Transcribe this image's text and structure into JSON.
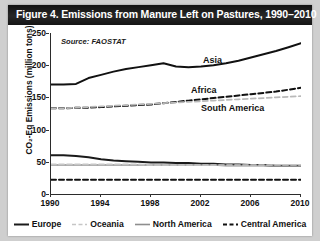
{
  "figure": {
    "title": "Figure 4. Emissions from Manure Left on Pastures, 1990–2010",
    "source_note": "Source: FAOSTAT"
  },
  "chart_data": {
    "type": "line",
    "title": "Figure 4. Emissions from Manure Left on Pastures, 1990–2010",
    "xlabel": "",
    "ylabel": "CO₂-Eq Emissions (million tons)",
    "xlim": [
      1990,
      2010
    ],
    "ylim": [
      0,
      250
    ],
    "yticks": [
      0,
      50,
      100,
      150,
      200,
      250
    ],
    "xticks": [
      1990,
      1994,
      1998,
      2002,
      2006,
      2010
    ],
    "grid": false,
    "legend_position": "bottom",
    "annotations": [
      "Source: FAOSTAT"
    ],
    "inline_labels": [
      "Asia",
      "Africa",
      "South America"
    ],
    "x": [
      1990,
      1991,
      1992,
      1993,
      1994,
      1995,
      1996,
      1997,
      1998,
      1999,
      2000,
      2001,
      2002,
      2003,
      2004,
      2005,
      2006,
      2007,
      2008,
      2009,
      2010
    ],
    "series": [
      {
        "name": "Asia",
        "style": "solid-black",
        "color": "#111111",
        "values": [
          170,
          170,
          171,
          180,
          185,
          190,
          194,
          197,
          200,
          203,
          198,
          197,
          198,
          200,
          203,
          207,
          212,
          217,
          222,
          228,
          234
        ]
      },
      {
        "name": "Africa",
        "style": "dashed-black",
        "color": "#111111",
        "values": [
          133,
          133,
          134,
          134,
          135,
          136,
          137,
          138,
          139,
          141,
          143,
          145,
          147,
          149,
          151,
          153,
          155,
          157,
          159,
          162,
          165
        ]
      },
      {
        "name": "South America",
        "style": "dashed-light",
        "color": "#b9b9b9",
        "values": [
          133,
          133,
          134,
          135,
          136,
          137,
          138,
          139,
          140,
          141,
          142,
          143,
          144,
          145,
          146,
          147,
          148,
          149,
          150,
          151,
          152
        ]
      },
      {
        "name": "Europe",
        "style": "solid-black",
        "color": "#1a1a1a",
        "values": [
          60,
          60,
          59,
          57,
          54,
          52,
          51,
          50,
          49,
          49,
          48,
          48,
          47,
          47,
          46,
          46,
          45,
          45,
          44,
          44,
          44
        ]
      },
      {
        "name": "North America",
        "style": "solid-gray",
        "color": "#8e8e8e",
        "values": [
          45,
          45,
          45,
          45,
          45,
          45,
          45,
          45,
          45,
          45,
          45,
          45,
          45,
          45,
          44,
          44,
          44,
          44,
          43,
          43,
          43
        ]
      },
      {
        "name": "Oceania",
        "style": "dashed-light",
        "color": "#c6c6c6",
        "values": [
          46,
          46,
          46,
          46,
          46,
          46,
          46,
          46,
          45,
          45,
          45,
          45,
          45,
          45,
          45,
          45,
          45,
          45,
          45,
          45,
          45
        ]
      },
      {
        "name": "Central America",
        "style": "dashed-black",
        "color": "#111111",
        "values": [
          22,
          22,
          22,
          22,
          22,
          22,
          22,
          22,
          22,
          22,
          22,
          22,
          22,
          22,
          22,
          22,
          22,
          22,
          22,
          22,
          22
        ]
      }
    ]
  },
  "legend": [
    {
      "label": "Europe",
      "style": "solid-black",
      "color": "#1a1a1a"
    },
    {
      "label": "Oceania",
      "style": "dashed-light",
      "color": "#c6c6c6"
    },
    {
      "label": "North America",
      "style": "solid-gray",
      "color": "#8e8e8e"
    },
    {
      "label": "Central America",
      "style": "dashed-black",
      "color": "#111111"
    }
  ],
  "inline_labels": [
    {
      "text": "Asia",
      "x": 152,
      "y": 22
    },
    {
      "text": "Africa",
      "x": 140,
      "y": 52
    },
    {
      "text": "South America",
      "x": 150,
      "y": 70
    }
  ]
}
